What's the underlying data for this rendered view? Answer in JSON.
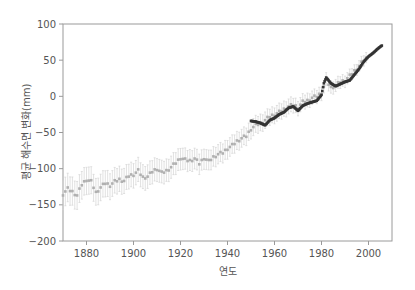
{
  "chart_data": {
    "type": "scatter",
    "title": "",
    "xlabel": "연도",
    "ylabel": "평균 해수면 변화(mm)",
    "xlim": [
      1870,
      2010
    ],
    "ylim": [
      -200,
      100
    ],
    "xticks": [
      1880,
      1900,
      1920,
      1940,
      1960,
      1980,
      2000
    ],
    "yticks": [
      100,
      50,
      0,
      -50,
      -100,
      -150,
      -200
    ],
    "ytick_labels": [
      "100",
      "50",
      "0",
      "−50",
      "−100",
      "−150",
      "−200"
    ],
    "grid": false,
    "legend": null,
    "series": [
      {
        "name": "reconstruction (with error bars)",
        "color": "#b0b0b0",
        "x": [
          1870,
          1872,
          1874,
          1876,
          1878,
          1880,
          1882,
          1884,
          1886,
          1888,
          1890,
          1892,
          1894,
          1896,
          1898,
          1900,
          1902,
          1904,
          1906,
          1908,
          1910,
          1912,
          1914,
          1916,
          1918,
          1920,
          1922,
          1924,
          1926,
          1928,
          1930,
          1932,
          1934,
          1936,
          1938,
          1940,
          1942,
          1944,
          1946,
          1948,
          1950,
          1952,
          1954,
          1956,
          1958,
          1960,
          1962,
          1964,
          1966,
          1968,
          1970,
          1972,
          1974,
          1976,
          1978,
          1980,
          1982,
          1984,
          1986,
          1988,
          1990,
          1992,
          1994,
          1996,
          1998,
          2000
        ],
        "y": [
          -135,
          -128,
          -132,
          -137,
          -122,
          -115,
          -118,
          -133,
          -126,
          -120,
          -123,
          -118,
          -115,
          -117,
          -110,
          -108,
          -103,
          -112,
          -111,
          -104,
          -100,
          -106,
          -103,
          -98,
          -92,
          -85,
          -88,
          -89,
          -86,
          -93,
          -85,
          -90,
          -84,
          -80,
          -78,
          -72,
          -68,
          -62,
          -58,
          -55,
          -45,
          -40,
          -37,
          -33,
          -28,
          -25,
          -22,
          -18,
          -14,
          -12,
          -15,
          -8,
          -6,
          -2,
          0,
          5,
          22,
          12,
          15,
          20,
          22,
          28,
          35,
          42,
          50,
          55
        ],
        "error": 20
      },
      {
        "name": "tide gauge",
        "color": "#333333",
        "x": [
          1950,
          1952,
          1954,
          1956,
          1958,
          1960,
          1962,
          1964,
          1966,
          1968,
          1970,
          1972,
          1974,
          1976,
          1978,
          1980,
          1981,
          1982,
          1984,
          1986,
          1988,
          1990,
          1992,
          1994,
          1996,
          1998,
          2000,
          2002,
          2004,
          2006
        ],
        "y": [
          -34,
          -35,
          -37,
          -40,
          -33,
          -30,
          -25,
          -22,
          -16,
          -14,
          -20,
          -13,
          -10,
          -8,
          -6,
          2,
          18,
          26,
          18,
          14,
          17,
          20,
          22,
          30,
          38,
          48,
          55,
          60,
          66,
          71
        ]
      }
    ]
  }
}
